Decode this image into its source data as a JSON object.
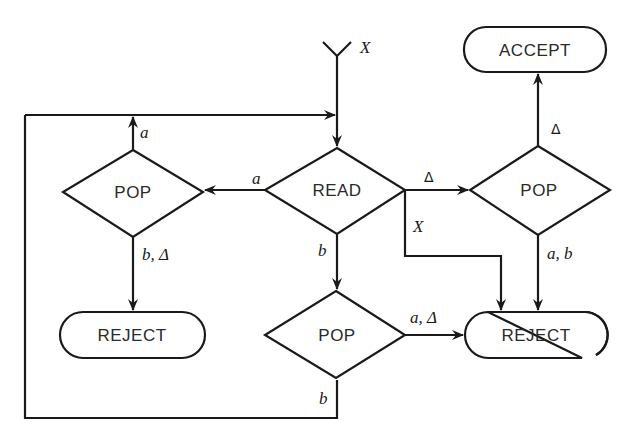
{
  "diagram": {
    "type": "flowchart",
    "colors": {
      "stroke": "#1a1a1a",
      "text": "#2a2a2a",
      "background": "#ffffff"
    },
    "start": {
      "label": "X"
    },
    "nodes": {
      "read": {
        "label": "READ",
        "shape": "diamond"
      },
      "pop_left": {
        "label": "POP",
        "shape": "diamond"
      },
      "pop_right": {
        "label": "POP",
        "shape": "diamond"
      },
      "pop_bottom": {
        "label": "POP",
        "shape": "diamond"
      },
      "accept": {
        "label": "ACCEPT",
        "shape": "terminal"
      },
      "reject_left": {
        "label": "REJECT",
        "shape": "terminal"
      },
      "reject_right": {
        "label": "REJECT",
        "shape": "terminal"
      }
    },
    "edges": {
      "read_to_pop_left": {
        "label": "a"
      },
      "read_to_pop_right": {
        "label": "Δ"
      },
      "read_to_reject_right": {
        "label": "X"
      },
      "read_to_pop_bottom": {
        "label": "b"
      },
      "pop_left_to_read": {
        "label": "a"
      },
      "pop_left_to_reject_left": {
        "label": "b, Δ"
      },
      "pop_right_to_accept": {
        "label": "Δ"
      },
      "pop_right_to_reject_right": {
        "label": "a, b"
      },
      "pop_bottom_to_reject_right": {
        "label": "a, Δ"
      },
      "pop_bottom_to_read": {
        "label": "b"
      }
    }
  }
}
